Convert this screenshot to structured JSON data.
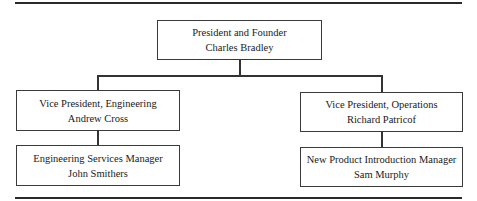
{
  "org_chart": {
    "root": {
      "title": "President and Founder",
      "name": "Charles Bradley"
    },
    "branches": [
      {
        "head": {
          "title": "Vice President, Engineering",
          "name": "Andrew Cross"
        },
        "report": {
          "title": "Engineering Services Manager",
          "name": "John Smithers"
        }
      },
      {
        "head": {
          "title": "Vice President, Operations",
          "name": "Richard Patricof"
        },
        "report": {
          "title": "New Product Introduction Manager",
          "name": "Sam Murphy"
        }
      }
    ]
  },
  "colors": {
    "lines": "#333333",
    "text": "#1a1a1a",
    "background": "#ffffff"
  }
}
